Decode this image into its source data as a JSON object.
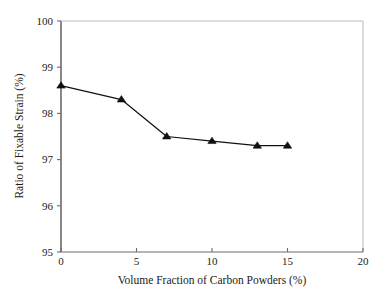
{
  "chart_data": {
    "type": "line",
    "title": "",
    "xlabel": "Volume Fraction of Carbon Powders (%)",
    "ylabel": "Ratio of Fixable Strain (%)",
    "xlim": [
      0,
      20
    ],
    "ylim": [
      95,
      100
    ],
    "xticks": [
      0,
      5,
      10,
      15,
      20
    ],
    "yticks": [
      95,
      96,
      97,
      98,
      99,
      100
    ],
    "xtick_labels": [
      "0",
      "5",
      "10",
      "15",
      "20"
    ],
    "ytick_labels": [
      "95",
      "96",
      "97",
      "98",
      "99",
      "100"
    ],
    "grid": false,
    "legend": null,
    "marker": "filled-triangle-up",
    "line_color": "#111111",
    "marker_color": "#111111",
    "x": [
      0,
      4,
      7,
      10,
      13,
      15
    ],
    "values": [
      98.6,
      98.3,
      97.5,
      97.4,
      97.3,
      97.3
    ],
    "series": [
      {
        "name": "Ratio of Fixable Strain",
        "x": [
          0,
          4,
          7,
          10,
          13,
          15
        ],
        "values": [
          98.6,
          98.3,
          97.5,
          97.4,
          97.3,
          97.3
        ]
      }
    ]
  },
  "axes": {
    "x_title": "Volume Fraction of Carbon Powders (%)",
    "y_title": "Ratio of Fixable Strain (%)"
  },
  "colors": {
    "data": "#111111",
    "spine_major": "#6b6b6b",
    "spine_minor": "#b9b9b9",
    "background": "#ffffff",
    "text": "#1a1a1a"
  }
}
